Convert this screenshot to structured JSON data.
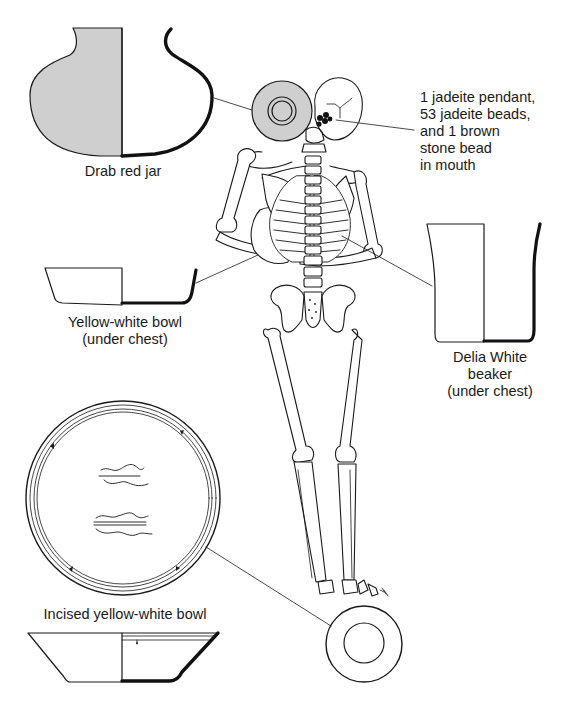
{
  "figure": {
    "type": "burial-diagram",
    "colors": {
      "line": "#1a1a1a",
      "fill_gray": "#cfcfcf",
      "background": "#ffffff",
      "section_black": "#111111"
    }
  },
  "artifacts": [
    {
      "id": "drab-red-jar",
      "label": "Drab red jar"
    },
    {
      "id": "jadeite-ornaments",
      "label_lines": [
        "1 jadeite pendant,",
        "53 jadeite beads,",
        "and 1 brown",
        "stone bead",
        "in mouth"
      ]
    },
    {
      "id": "yellow-white-bowl",
      "label_lines": [
        "Yellow-white bowl",
        "(under chest)"
      ]
    },
    {
      "id": "delia-white-beaker",
      "label_lines": [
        "Delia White",
        "beaker",
        "(under chest)"
      ]
    },
    {
      "id": "incised-yellow-white-bowl",
      "label": "Incised yellow-white bowl"
    }
  ]
}
